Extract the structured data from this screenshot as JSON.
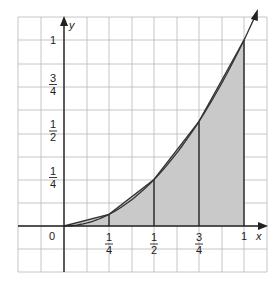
{
  "figure": {
    "type": "trapezoidal-rule-illustration",
    "function": "y = x^2",
    "axes": {
      "x_label": "x",
      "y_label": "y",
      "origin_label": "0",
      "x_ticks": [
        {
          "value": 0.25,
          "num": "1",
          "den": "4"
        },
        {
          "value": 0.5,
          "num": "1",
          "den": "2"
        },
        {
          "value": 0.75,
          "num": "3",
          "den": "4"
        },
        {
          "value": 1,
          "label": "1"
        }
      ],
      "y_ticks": [
        {
          "value": 0.25,
          "num": "1",
          "den": "4"
        },
        {
          "value": 0.5,
          "num": "1",
          "den": "2"
        },
        {
          "value": 0.75,
          "num": "3",
          "den": "4"
        },
        {
          "value": 1,
          "label": "1"
        }
      ]
    },
    "partition": [
      0,
      0.25,
      0.5,
      0.75,
      1
    ],
    "chord_points": [
      [
        0,
        0
      ],
      [
        0.25,
        0.0625
      ],
      [
        0.5,
        0.25
      ],
      [
        0.75,
        0.5625
      ],
      [
        1,
        1
      ]
    ],
    "colors": {
      "grid": "#b8b8b8",
      "axis": "#222222",
      "curve": "#333333",
      "fill": "#c9c9c9"
    }
  }
}
